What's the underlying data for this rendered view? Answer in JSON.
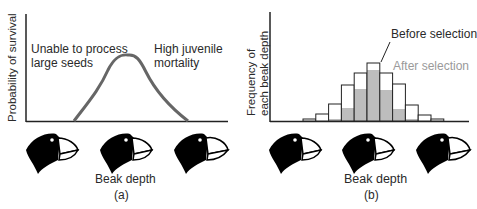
{
  "panel_a": {
    "ylabel": "Probability of survival",
    "annotation_left_line1": "Unable to process",
    "annotation_left_line2": "large seeds",
    "annotation_right_line1": "High juvenile",
    "annotation_right_line2": "mortality",
    "xlabel": "Beak depth",
    "caption": "(a)",
    "curve_color": "#666666"
  },
  "panel_b": {
    "ylabel_line1": "Frequency of",
    "ylabel_line2": "each beak depth",
    "legend_before": "Before selection",
    "legend_after": "After selection",
    "xlabel": "Beak depth",
    "caption": "(b)",
    "before_fill": "#ffffff",
    "after_fill": "#bdbdbd",
    "after_label_color": "#9a9a9a"
  },
  "chart_data": [
    {
      "type": "line",
      "title": "",
      "xlabel": "Beak depth",
      "ylabel": "Probability of survival",
      "x": [
        0,
        1,
        2,
        3,
        4,
        5,
        6,
        7,
        8,
        9,
        10
      ],
      "values": [
        0,
        0.05,
        0.25,
        0.65,
        1.0,
        0.85,
        0.55,
        0.3,
        0.12,
        0.03,
        0
      ],
      "annotations": [
        "Unable to process large seeds",
        "High juvenile mortality"
      ],
      "grid": false
    },
    {
      "type": "bar",
      "title": "",
      "xlabel": "Beak depth",
      "ylabel": "Frequency of each beak depth",
      "categories": [
        "1",
        "2",
        "3",
        "4",
        "5",
        "6",
        "7",
        "8",
        "9",
        "10",
        "11"
      ],
      "series": [
        {
          "name": "Before selection",
          "values": [
            2,
            7,
            17,
            36,
            48,
            58,
            48,
            37,
            16,
            6,
            2
          ]
        },
        {
          "name": "After selection",
          "values": [
            0,
            0,
            2,
            13,
            32,
            51,
            31,
            12,
            2,
            0,
            0
          ]
        }
      ],
      "legend_position": "top-right",
      "grid": false
    }
  ]
}
